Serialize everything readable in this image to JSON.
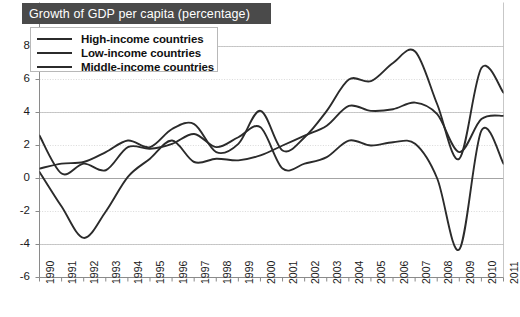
{
  "title": "Growth of GDP per capita (percentage)",
  "legend": {
    "items": [
      {
        "label": "High-income countries",
        "color": "#2b2b2b"
      },
      {
        "label": "Low-income countries",
        "color": "#2b2b2b"
      },
      {
        "label": "Middle-income countries",
        "color": "#2b2b2b"
      }
    ]
  },
  "chart_data": {
    "type": "line",
    "title": "Growth of GDP per capita (percentage)",
    "xlabel": "",
    "ylabel": "",
    "ylim": [
      -6,
      8
    ],
    "yticks": [
      8,
      6,
      4,
      2,
      0,
      -2,
      -4,
      -6
    ],
    "ytick_labels": [
      "8",
      "6",
      "4",
      "2",
      "0",
      "-2",
      "-4",
      "-6"
    ],
    "grid": true,
    "legend_position": "top-left",
    "categories": [
      1990,
      1991,
      1992,
      1993,
      1994,
      1995,
      1996,
      1997,
      1998,
      1999,
      2000,
      2001,
      2002,
      2003,
      2004,
      2005,
      2006,
      2007,
      2008,
      2009,
      2010,
      2011
    ],
    "xtick_labels": [
      "1990",
      "1991",
      "1992",
      "1993",
      "1994",
      "1995",
      "1996",
      "1997",
      "1998",
      "1999",
      "2000",
      "2001",
      "2002",
      "2003",
      "2004",
      "2005",
      "2006",
      "2007",
      "2008",
      "2009",
      "2010",
      "2011"
    ],
    "series": [
      {
        "name": "High-income countries",
        "color": "#2b2b2b",
        "values": [
          2.6,
          0.3,
          0.9,
          0.5,
          1.9,
          1.8,
          2.1,
          2.7,
          1.9,
          2.5,
          3.1,
          0.6,
          0.9,
          1.3,
          2.3,
          2.0,
          2.2,
          2.1,
          0.0,
          -4.3,
          2.9,
          0.9
        ]
      },
      {
        "name": "Low-income countries",
        "color": "#2b2b2b",
        "values": [
          0.4,
          -1.7,
          -3.6,
          -2.0,
          0.1,
          1.2,
          2.3,
          1.0,
          1.2,
          1.1,
          1.4,
          2.0,
          2.6,
          3.2,
          4.4,
          4.1,
          4.2,
          4.6,
          3.9,
          1.6,
          3.6,
          3.8
        ]
      },
      {
        "name": "Middle-income countries",
        "color": "#2b2b2b",
        "values": [
          0.6,
          0.9,
          1.0,
          1.6,
          2.3,
          1.9,
          3.0,
          3.3,
          1.6,
          2.1,
          4.1,
          1.7,
          2.5,
          4.1,
          6.0,
          5.9,
          7.0,
          7.7,
          4.5,
          1.2,
          6.7,
          5.2
        ]
      }
    ]
  },
  "axes": {
    "y_axis_name": "y-axis",
    "x_axis_name": "x-axis"
  }
}
